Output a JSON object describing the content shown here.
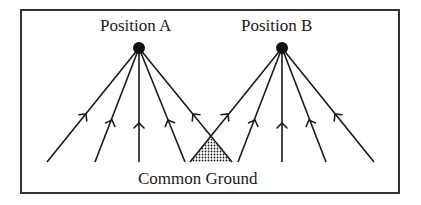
{
  "diagram": {
    "positions": [
      {
        "id": "A",
        "label": "Position A",
        "node": [
          139,
          48
        ]
      },
      {
        "id": "B",
        "label": "Position B",
        "node": [
          282,
          48
        ]
      }
    ],
    "common_ground_label": "Common Ground",
    "colors": {
      "stroke": "#1a1a1a",
      "frame": "#333333",
      "background": "#ffffff"
    },
    "arrow_direction": "upward toward position node"
  }
}
